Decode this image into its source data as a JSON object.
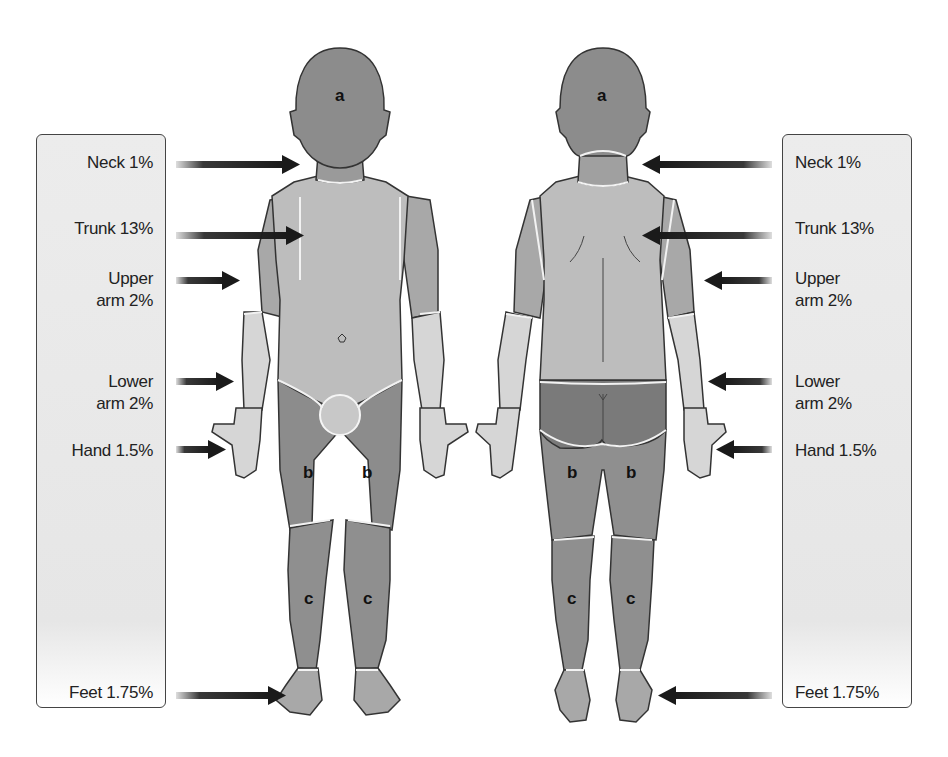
{
  "figure": {
    "colors": {
      "head_region_a": "#8c8c8c",
      "thigh_region_b": "#8c8c8c",
      "leg_region_c": "#8c8c8c",
      "trunk": "#bdbdbd",
      "upper_arm": "#a8a8a8",
      "lower_arm_hand": "#d6d6d6",
      "buttocks": "#7a7a7a",
      "panel_bg": "#e8e8e8",
      "arrow": "#222222",
      "outline": "#333333"
    },
    "region_letters": {
      "head": "a",
      "thigh": "b",
      "leg": "c"
    },
    "left_panel": {
      "labels": [
        {
          "id": "neck",
          "line1": "Neck 1%",
          "line2": ""
        },
        {
          "id": "trunk",
          "line1": "Trunk 13%",
          "line2": ""
        },
        {
          "id": "upper_arm",
          "line1": "Upper",
          "line2": "arm 2%"
        },
        {
          "id": "lower_arm",
          "line1": "Lower",
          "line2": "arm 2%"
        },
        {
          "id": "hand",
          "line1": "Hand 1.5%",
          "line2": ""
        },
        {
          "id": "feet",
          "line1": "Feet 1.75%",
          "line2": ""
        }
      ]
    },
    "right_panel": {
      "labels": [
        {
          "id": "neck",
          "line1": "Neck 1%",
          "line2": ""
        },
        {
          "id": "trunk",
          "line1": "Trunk 13%",
          "line2": ""
        },
        {
          "id": "upper_arm",
          "line1": "Upper",
          "line2": "arm 2%"
        },
        {
          "id": "lower_arm",
          "line1": "Lower",
          "line2": "arm 2%"
        },
        {
          "id": "hand",
          "line1": "Hand 1.5%",
          "line2": ""
        },
        {
          "id": "feet",
          "line1": "Feet 1.75%",
          "line2": ""
        }
      ]
    }
  }
}
